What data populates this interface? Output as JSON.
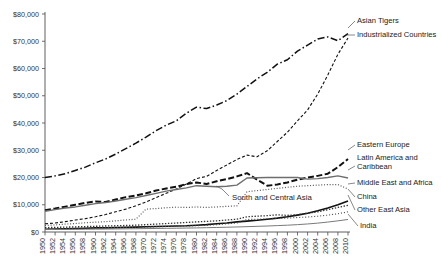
{
  "chart_data": {
    "type": "line",
    "title": "",
    "xlabel": "",
    "ylabel": "",
    "ylim": [
      0,
      80000
    ],
    "xlim": [
      1950,
      2010
    ],
    "grid": false,
    "legend_position": "right-inline-labels",
    "y_ticks": [
      "$0",
      "$10,000",
      "$20,000",
      "$30,000",
      "$40,000",
      "$50,000",
      "$60,000",
      "$70,000",
      "$80,000"
    ],
    "y_tick_values": [
      0,
      10000,
      20000,
      30000,
      40000,
      50000,
      60000,
      70000,
      80000
    ],
    "x": [
      1950,
      1952,
      1954,
      1956,
      1958,
      1960,
      1962,
      1964,
      1966,
      1968,
      1970,
      1972,
      1974,
      1976,
      1978,
      1980,
      1982,
      1984,
      1986,
      1988,
      1990,
      1992,
      1994,
      1996,
      1998,
      2000,
      2002,
      2004,
      2006,
      2008,
      2010
    ],
    "x_tick_labels": [
      "1950",
      "1952",
      "1954",
      "1956",
      "1958",
      "1960",
      "1962",
      "1964",
      "1966",
      "1968",
      "1970",
      "1972",
      "1974",
      "1976",
      "1978",
      "1980",
      "1982",
      "1984",
      "1986",
      "1988",
      "1990",
      "1992",
      "1994",
      "1996",
      "1998",
      "2000",
      "2002",
      "2004",
      "2006",
      "2008",
      "2010"
    ],
    "series": [
      {
        "name": "Asian Tigers",
        "label": "Asian Tigers",
        "style": "dash-dot",
        "width": 1.5,
        "color": "#111111",
        "values": [
          20000,
          20600,
          21400,
          22600,
          23800,
          25400,
          26800,
          28600,
          30600,
          32600,
          34800,
          37200,
          39200,
          40800,
          43600,
          45800,
          45300,
          46600,
          48200,
          50600,
          53400,
          56200,
          58600,
          61600,
          63200,
          66400,
          68600,
          70800,
          71600,
          70200,
          72800
        ]
      },
      {
        "name": "Industrialized Countries",
        "label": "Industrialized Countries",
        "style": "dashed-fine",
        "width": 1.1,
        "color": "#111111",
        "values": [
          3000,
          3300,
          3800,
          4400,
          4900,
          5600,
          6400,
          7400,
          8400,
          9600,
          11000,
          12600,
          14200,
          15800,
          17600,
          19600,
          20400,
          22600,
          24600,
          26600,
          28200,
          27600,
          29800,
          33200,
          36600,
          40800,
          44800,
          50600,
          57600,
          65200,
          71200
        ]
      },
      {
        "name": "Eastern Europe",
        "label": "Eastern Europe",
        "style": "dashed-bold",
        "width": 2.0,
        "color": "#111111",
        "values": [
          8000,
          8600,
          9300,
          10000,
          10700,
          11200,
          11000,
          11900,
          12800,
          13400,
          14200,
          15200,
          16000,
          16600,
          17600,
          18200,
          17600,
          18600,
          19400,
          20400,
          21600,
          19200,
          17000,
          17400,
          18200,
          19200,
          20000,
          20600,
          21400,
          23800,
          26800
        ]
      },
      {
        "name": "Latin America and Caribbean",
        "label": "Latin America and Caribbean",
        "style": "solid-grey",
        "width": 1.4,
        "color": "#6e6e6e",
        "values": [
          7600,
          8200,
          8800,
          9200,
          9800,
          10400,
          10800,
          11400,
          12000,
          12600,
          13400,
          14200,
          15000,
          15600,
          16200,
          17000,
          16800,
          16600,
          16800,
          17200,
          19800,
          19900,
          20000,
          20000,
          20000,
          20000,
          19400,
          19600,
          20000,
          20600,
          19800
        ]
      },
      {
        "name": "Middle East and Africa",
        "label": "Middle East and Africa",
        "style": "dotted",
        "width": 1.2,
        "color": "#555555",
        "values": [
          2400,
          2600,
          2900,
          3100,
          3400,
          3600,
          3800,
          4100,
          4400,
          4700,
          8400,
          8600,
          8900,
          9100,
          9000,
          9200,
          9000,
          9200,
          9400,
          9600,
          14800,
          15200,
          15600,
          16000,
          16400,
          16800,
          17000,
          17200,
          17400,
          17400,
          15800
        ]
      },
      {
        "name": "China",
        "label": "China",
        "style": "solid-black",
        "width": 1.6,
        "color": "#111111",
        "values": [
          1000,
          1100,
          1200,
          1300,
          1400,
          1500,
          1500,
          1600,
          1700,
          1800,
          1900,
          2000,
          2100,
          2200,
          2300,
          2500,
          2700,
          3000,
          3300,
          3700,
          4000,
          4300,
          4700,
          5100,
          5600,
          6200,
          6900,
          7800,
          8800,
          10000,
          11400
        ]
      },
      {
        "name": "Other East Asia",
        "label": "Other East Asia",
        "style": "dotted-bold",
        "width": 1.3,
        "color": "#333333",
        "values": [
          1600,
          1700,
          1800,
          1900,
          2000,
          2100,
          2200,
          2300,
          2400,
          2500,
          2700,
          2900,
          3100,
          3300,
          3500,
          3700,
          3900,
          4100,
          4400,
          4700,
          5600,
          5800,
          6000,
          6300,
          6100,
          6400,
          6900,
          7400,
          8200,
          9000,
          9800
        ]
      },
      {
        "name": "South and Central Asia",
        "label": "South and Central Asia",
        "style": "dotted-fine",
        "width": 1.1,
        "color": "#444444",
        "values": [
          1300,
          1350,
          1400,
          1450,
          1500,
          1550,
          1600,
          1650,
          1700,
          1750,
          1800,
          1900,
          2000,
          2100,
          2200,
          2300,
          2500,
          2700,
          3000,
          3300,
          4600,
          4700,
          4800,
          5000,
          5100,
          5300,
          5500,
          5800,
          6200,
          6700,
          7400
        ]
      },
      {
        "name": "India",
        "label": "India",
        "style": "solid-thin",
        "width": 1.0,
        "color": "#7a7a7a",
        "values": [
          900,
          930,
          960,
          990,
          1020,
          1050,
          1080,
          1120,
          1160,
          1200,
          1250,
          1300,
          1350,
          1400,
          1450,
          1500,
          1580,
          1660,
          1750,
          1850,
          1960,
          2080,
          2200,
          2350,
          2500,
          2700,
          2950,
          3250,
          3650,
          4100,
          4600
        ]
      }
    ],
    "annotations": [
      {
        "text": "South and Central Asia",
        "kind": "inline-label"
      }
    ]
  }
}
